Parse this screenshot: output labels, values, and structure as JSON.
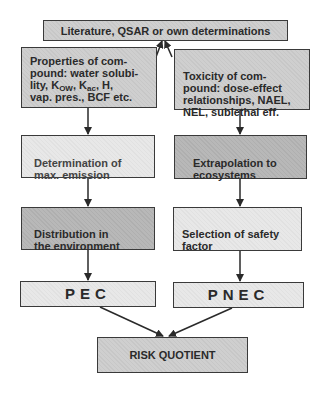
{
  "diagram": {
    "source": {
      "label": "Literature, QSAR or own determinations"
    },
    "left_column": {
      "properties": {
        "label": "Properties of com-\npound: water solubi-\nlity, K_OW, K_ac, H,\nvap. pres., BCF etc."
      },
      "properties_lines": [
        "Properties of com-",
        "pound: water solubi-",
        "lity, K",
        "OW",
        ", K",
        "ac",
        ", H,",
        "vap. pres., BCF etc."
      ],
      "emission": {
        "label": "Determination of\nmax. emission"
      },
      "distribution": {
        "label": "Distribution in\nthe environment"
      },
      "pec": {
        "label": "PEC"
      }
    },
    "right_column": {
      "toxicity": {
        "label": "Toxicity of com-\npound: dose-effect\nrelationships, NAEL,\nNEL, sublethal eff."
      },
      "extrapolation": {
        "label": "Extrapolation to\necosystems"
      },
      "safety_factor": {
        "label": "Selection of safety\nfactor"
      },
      "pnec": {
        "label": "PNEC"
      }
    },
    "result": {
      "label": "RISK QUOTIENT"
    },
    "colors": {
      "line": "#2a2a2a",
      "light_fill": "#e8e8e8",
      "mid_fill": "#cfcfcf",
      "dark_fill": "#b8b8b8"
    },
    "edges": [
      {
        "from": "properties",
        "to": "source"
      },
      {
        "from": "toxicity",
        "to": "source"
      },
      {
        "from": "properties",
        "to": "emission"
      },
      {
        "from": "emission",
        "to": "distribution"
      },
      {
        "from": "distribution",
        "to": "pec"
      },
      {
        "from": "toxicity",
        "to": "extrapolation"
      },
      {
        "from": "extrapolation",
        "to": "safety_factor"
      },
      {
        "from": "safety_factor",
        "to": "pnec"
      },
      {
        "from": "pec",
        "to": "result"
      },
      {
        "from": "pnec",
        "to": "result"
      }
    ]
  }
}
